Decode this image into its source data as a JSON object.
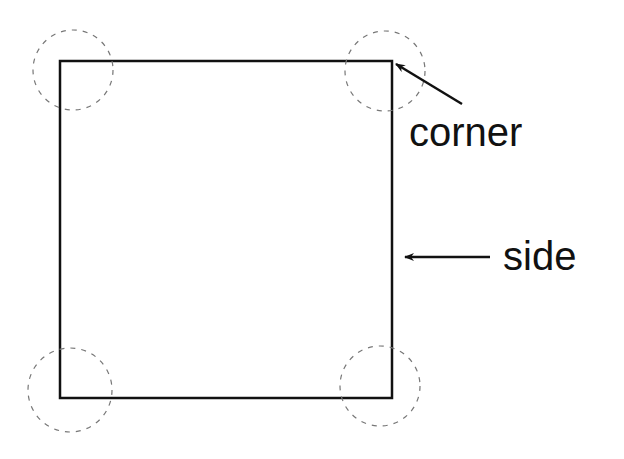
{
  "diagram": {
    "title": "",
    "shape": "square",
    "colors": {
      "stroke": "#111111",
      "dashed_circle": "#777777",
      "background": "#ffffff"
    },
    "labels": {
      "corner": "corner",
      "side": "side"
    },
    "corner_markers": [
      {
        "position": "top-left"
      },
      {
        "position": "top-right"
      },
      {
        "position": "bottom-left"
      },
      {
        "position": "bottom-right"
      }
    ],
    "arrows": [
      {
        "label": "corner",
        "points_to": "top-right corner"
      },
      {
        "label": "side",
        "points_to": "right side"
      }
    ]
  }
}
